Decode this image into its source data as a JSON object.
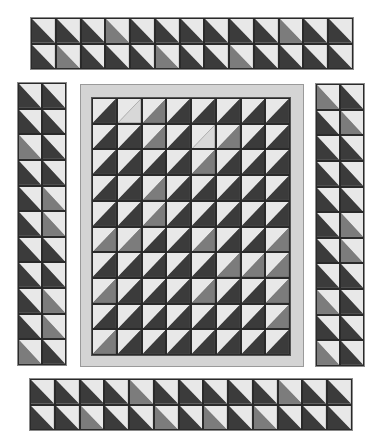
{
  "colors": {
    "light": "#e8e8e8",
    "dark": "#3b3b3b",
    "mid": "#7c7c7c",
    "frame": "#d4d4d4"
  },
  "top_border": {
    "cols": 13,
    "rows": 2,
    "orientation": "down",
    "cells": [
      [
        "D",
        "D",
        "D",
        "M",
        "D",
        "D",
        "D",
        "D",
        "D",
        "D",
        "M",
        "D",
        "D"
      ],
      [
        "D",
        "M",
        "D",
        "D",
        "D",
        "M",
        "D",
        "D",
        "M",
        "D",
        "D",
        "D",
        "D"
      ]
    ]
  },
  "bottom_border": {
    "cols": 13,
    "rows": 2,
    "orientation": "down",
    "cells": [
      [
        "D",
        "D",
        "D",
        "D",
        "M",
        "D",
        "D",
        "D",
        "D",
        "D",
        "M",
        "D",
        "D"
      ],
      [
        "D",
        "D",
        "M",
        "D",
        "D",
        "M",
        "D",
        "M",
        "D",
        "M",
        "D",
        "D",
        "D"
      ]
    ]
  },
  "left_border": {
    "cols": 2,
    "rows": 11,
    "orientation": "down",
    "cells": [
      [
        "D",
        "D"
      ],
      [
        "D",
        "D"
      ],
      [
        "M",
        "D"
      ],
      [
        "D",
        "D"
      ],
      [
        "D",
        "M"
      ],
      [
        "D",
        "M"
      ],
      [
        "D",
        "D"
      ],
      [
        "D",
        "D"
      ],
      [
        "D",
        "M"
      ],
      [
        "D",
        "M"
      ],
      [
        "M",
        "D"
      ]
    ]
  },
  "right_border": {
    "cols": 2,
    "rows": 11,
    "orientation": "down",
    "cells": [
      [
        "M",
        "D"
      ],
      [
        "D",
        "M"
      ],
      [
        "D",
        "D"
      ],
      [
        "D",
        "D"
      ],
      [
        "D",
        "D"
      ],
      [
        "D",
        "M"
      ],
      [
        "D",
        "M"
      ],
      [
        "D",
        "D"
      ],
      [
        "M",
        "D"
      ],
      [
        "D",
        "D"
      ],
      [
        "M",
        "D"
      ]
    ]
  },
  "center": {
    "cols": 8,
    "rows": 10,
    "orientation": "up",
    "cells": [
      [
        "D",
        "L",
        "M",
        "D",
        "D",
        "D",
        "D",
        "D"
      ],
      [
        "D",
        "D",
        "M",
        "D",
        "L",
        "M",
        "D",
        "D"
      ],
      [
        "D",
        "D",
        "D",
        "D",
        "M",
        "D",
        "D",
        "D"
      ],
      [
        "D",
        "D",
        "M",
        "D",
        "D",
        "D",
        "D",
        "D"
      ],
      [
        "D",
        "D",
        "M",
        "D",
        "D",
        "D",
        "D",
        "D"
      ],
      [
        "M",
        "M",
        "D",
        "D",
        "M",
        "D",
        "D",
        "M"
      ],
      [
        "D",
        "D",
        "D",
        "D",
        "D",
        "M",
        "M",
        "M"
      ],
      [
        "M",
        "D",
        "D",
        "D",
        "M",
        "D",
        "D",
        "M"
      ],
      [
        "D",
        "D",
        "D",
        "D",
        "D",
        "D",
        "D",
        "M"
      ],
      [
        "M",
        "D",
        "D",
        "D",
        "D",
        "D",
        "D",
        "D"
      ]
    ]
  }
}
